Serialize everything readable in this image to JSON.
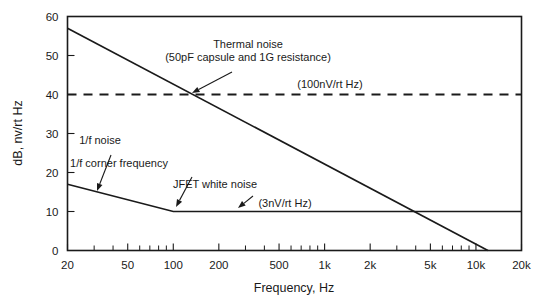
{
  "chart_data": {
    "type": "line",
    "title": "",
    "xlabel": "Frequency, Hz",
    "ylabel": "dB, nv/rt Hz",
    "xscale": "log",
    "yscale": "linear",
    "xlim": [
      20,
      20000
    ],
    "ylim": [
      0,
      60
    ],
    "grid": false,
    "legend": "none",
    "x_tick_labels": [
      "20",
      "50",
      "100",
      "200",
      "500",
      "1k",
      "2k",
      "5k",
      "10k",
      "20k"
    ],
    "x_tick_values": [
      20,
      50,
      100,
      200,
      500,
      1000,
      2000,
      5000,
      10000,
      20000
    ],
    "y_tick_labels": [
      "0",
      "10",
      "20",
      "30",
      "40",
      "50",
      "60"
    ],
    "y_tick_values": [
      0,
      10,
      20,
      30,
      40,
      50,
      60
    ],
    "series": [
      {
        "name": "Thermal noise",
        "style": "solid",
        "points": [
          [
            20,
            57
          ],
          [
            12000,
            0
          ]
        ]
      },
      {
        "name": "1/f noise and JFET white noise",
        "style": "solid",
        "points": [
          [
            20,
            17
          ],
          [
            100,
            10
          ],
          [
            20000,
            10
          ]
        ]
      },
      {
        "name": "100nV/rt Hz reference",
        "style": "dashed",
        "points": [
          [
            20,
            40
          ],
          [
            20000,
            40
          ]
        ]
      }
    ],
    "annotations": [
      {
        "name": "thermal-noise",
        "lines": [
          "Thermal noise",
          "(50pF capsule and 1G resistance)"
        ],
        "label_x": 248,
        "label_y": 48,
        "arrow_from": [
          232,
          72
        ],
        "arrow_to": [
          192,
          93
        ]
      },
      {
        "name": "reference-100nv",
        "lines": [
          "(100nV/rt Hz)"
        ],
        "label_x": 330,
        "label_y": 88,
        "arrow_from": null,
        "arrow_to": null
      },
      {
        "name": "one-over-f-noise",
        "lines": [
          "1/f noise"
        ],
        "label_x": 100,
        "label_y": 144,
        "arrow_from": [
          111,
          155
        ],
        "arrow_to": [
          97,
          191
        ]
      },
      {
        "name": "one-over-f-corner-frequency",
        "lines": [
          "1/f corner frequency"
        ],
        "label_x": 119,
        "label_y": 167,
        "arrow_from": [
          192,
          177
        ],
        "arrow_to": [
          176,
          207
        ]
      },
      {
        "name": "jfet-white-noise",
        "lines": [
          "JFET white noise"
        ],
        "label_x": 215,
        "label_y": 188,
        "arrow_from": [
          253,
          196
        ],
        "arrow_to": [
          238,
          208
        ]
      },
      {
        "name": "reference-3nv",
        "lines": [
          "(3nV/rt Hz)"
        ],
        "label_x": 285,
        "label_y": 207,
        "arrow_from": null,
        "arrow_to": null
      }
    ]
  },
  "colors": {
    "ink": "#1a1a1a",
    "background": "#ffffff"
  }
}
